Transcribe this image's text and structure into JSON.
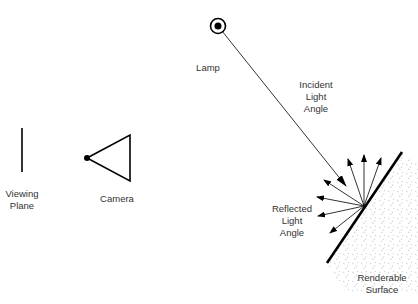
{
  "labels": {
    "lamp": "Lamp",
    "incident": "Incident\nLight\nAngle",
    "reflected": "Reflected\nLight\nAngle",
    "viewing_plane": "Viewing\nPlane",
    "camera": "Camera",
    "surface": "Renderable\nSurface"
  },
  "colors": {
    "stroke": "#000000",
    "text": "#333333",
    "stipple": "#aaaaaa"
  }
}
